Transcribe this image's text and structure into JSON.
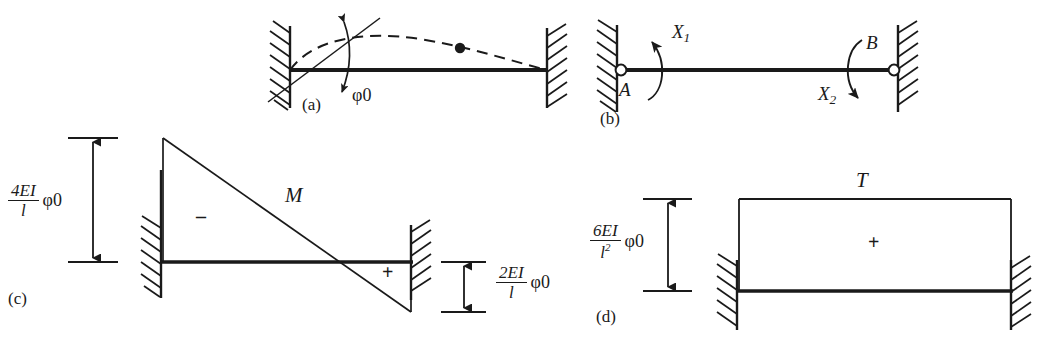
{
  "figure": {
    "panels": [
      {
        "tag": "(a)",
        "name": "deflected-shape",
        "labels": [
          {
            "id": "phi0",
            "text": "φ0",
            "meaning": "imposed end rotation at left support"
          }
        ],
        "description": "clamped-clamped beam, left end rotated by phi-0, dashed deflected curve with inflection point marker"
      },
      {
        "tag": "(b)",
        "name": "redundant-forces",
        "labels": [
          {
            "id": "A",
            "text": "A",
            "meaning": "left end node"
          },
          {
            "id": "B",
            "text": "B",
            "meaning": "right end node"
          },
          {
            "id": "X1",
            "text": "X",
            "sub": "1",
            "meaning": "redundant end moment at A"
          },
          {
            "id": "X2",
            "text": "X",
            "sub": "2",
            "meaning": "redundant end moment at B"
          }
        ],
        "description": "primary system with pinned ends and redundant moments X1 and X2"
      },
      {
        "tag": "(c)",
        "name": "bending-moment-diagram",
        "diagram_symbol": "M",
        "ordinates": [
          {
            "id": "left-ordinate",
            "numerator": "4EI",
            "denominator": "l",
            "factor": "φ0",
            "sign": "-",
            "value_text": "4EI/l φ0"
          },
          {
            "id": "right-ordinate",
            "numerator": "2EI",
            "denominator": "l",
            "factor": "φ0",
            "sign": "+",
            "value_text": "2EI/l φ0"
          }
        ],
        "sign_marks": [
          {
            "id": "negative-zone",
            "text": "–"
          },
          {
            "id": "positive-zone",
            "text": "+"
          }
        ]
      },
      {
        "tag": "(d)",
        "name": "shear-force-diagram",
        "diagram_symbol": "T",
        "ordinates": [
          {
            "id": "constant-ordinate",
            "numerator": "6EI",
            "denominator": "l",
            "denominator_exponent": "2",
            "factor": "φ0",
            "sign": "+",
            "value_text": "6EI/l² φ0"
          }
        ],
        "sign_marks": [
          {
            "id": "positive-zone",
            "text": "+"
          }
        ]
      }
    ],
    "colors": {
      "ink": "#1a1a1a",
      "background": "#ffffff"
    }
  }
}
